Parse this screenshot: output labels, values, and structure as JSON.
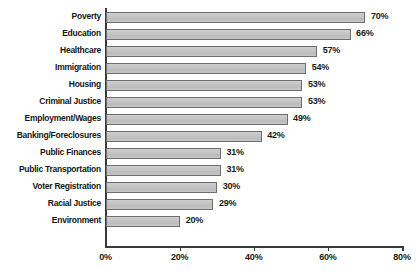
{
  "chart_data": {
    "type": "bar",
    "orientation": "horizontal",
    "title": "",
    "subtitle": "",
    "xlabel": "",
    "ylabel": "",
    "xlim": [
      0,
      80
    ],
    "grid": false,
    "legend": null,
    "tick_labels": [
      "0%",
      "20%",
      "40%",
      "60%",
      "80%"
    ],
    "tick_values": [
      0,
      20,
      40,
      60,
      80
    ],
    "categories": [
      "Poverty",
      "Education",
      "Healthcare",
      "Immigration",
      "Housing",
      "Criminal Justice",
      "Employment/Wages",
      "Banking/Foreclosures",
      "Public Finances",
      "Public Transportation",
      "Voter Registration",
      "Racial Justice",
      "Environment"
    ],
    "values": [
      70,
      66,
      57,
      54,
      53,
      53,
      49,
      42,
      31,
      31,
      30,
      29,
      20
    ],
    "value_labels": [
      "70%",
      "66%",
      "57%",
      "54%",
      "53%",
      "53%",
      "49%",
      "42%",
      "31%",
      "31%",
      "30%",
      "29%",
      "20%"
    ],
    "bar_color": "#c3c3c3",
    "bar_border_color": "#6e6e6e",
    "axis_color": "#3a3a3a",
    "text_color": "#161616",
    "background": "#ffffff"
  },
  "caption": {
    "text": ""
  }
}
